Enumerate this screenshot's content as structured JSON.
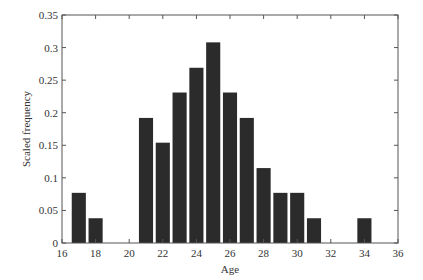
{
  "chart_data": {
    "type": "bar",
    "title": "",
    "xlabel": "Age",
    "ylabel": "Scaled frequency",
    "xlim": [
      16,
      36
    ],
    "ylim": [
      0,
      0.35
    ],
    "xticks": [
      16,
      18,
      20,
      22,
      24,
      26,
      28,
      30,
      32,
      34,
      36
    ],
    "yticks": [
      0,
      0.05,
      0.1,
      0.15,
      0.2,
      0.25,
      0.3,
      0.35
    ],
    "ytick_labels": [
      "0",
      "0.05",
      "0.1",
      "0.15",
      "0.2",
      "0.25",
      "0.3",
      "0.35"
    ],
    "grid": false,
    "legend": null,
    "bar_color": "#2b2b2b",
    "categories": [
      17,
      18,
      21,
      22,
      23,
      24,
      25,
      26,
      27,
      28,
      29,
      30,
      31,
      34
    ],
    "values": [
      0.077,
      0.038,
      0.192,
      0.154,
      0.231,
      0.269,
      0.308,
      0.231,
      0.192,
      0.115,
      0.077,
      0.077,
      0.038,
      0.038
    ]
  }
}
